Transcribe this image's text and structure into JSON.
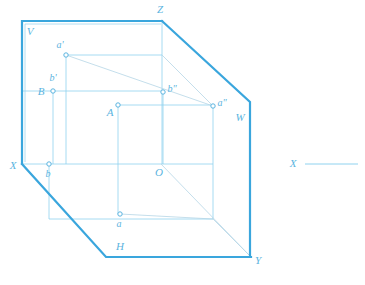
{
  "diagram": {
    "colors": {
      "outline": "#3aa6dd",
      "thin_line": "#7fcdec",
      "construction_line": "#a9d9ee",
      "label": "#5bb4e0",
      "background": "#ffffff",
      "marker_fill": "#ffffff"
    },
    "planes": [
      {
        "name": "vertical-plane",
        "label": "V",
        "x": 30,
        "y": 32
      },
      {
        "name": "horizontal-plane",
        "label": "H",
        "x": 120,
        "y": 247
      },
      {
        "name": "profile-plane",
        "label": "W",
        "x": 240,
        "y": 118
      }
    ],
    "axes": [
      {
        "name": "axis-z",
        "label": "Z",
        "x": 160,
        "y": 10
      },
      {
        "name": "axis-x",
        "label": "X",
        "x": 13,
        "y": 166
      },
      {
        "name": "axis-y",
        "label": "Y",
        "x": 258,
        "y": 261
      },
      {
        "name": "origin",
        "label": "O",
        "x": 159,
        "y": 173
      }
    ],
    "points": [
      {
        "name": "point-a-front-view",
        "label": "a'",
        "px": 66,
        "py": 55,
        "lx": 60,
        "ly": 46
      },
      {
        "name": "point-b-front-view",
        "label": "b'",
        "px": 53,
        "py": 91,
        "lx": 53,
        "ly": 79
      },
      {
        "name": "point-b-space",
        "label": "B",
        "px": 53,
        "py": 91,
        "lx": 41,
        "ly": 92
      },
      {
        "name": "point-b-profile-view",
        "label": "b\"",
        "px": 163,
        "py": 92,
        "lx": 171,
        "ly": 90
      },
      {
        "name": "point-a-space",
        "label": "A",
        "px": 118,
        "py": 105,
        "lx": 110,
        "ly": 113
      },
      {
        "name": "point-a-profile-view",
        "label": "a\"",
        "px": 213,
        "py": 106,
        "lx": 221,
        "ly": 104
      },
      {
        "name": "point-b-top-view",
        "label": "b",
        "px": 49,
        "py": 164,
        "lx": 48,
        "ly": 175
      },
      {
        "name": "point-a-top-view",
        "label": "a",
        "px": 120,
        "py": 214,
        "lx": 119,
        "ly": 225
      }
    ],
    "side_axis": {
      "name": "standalone-x-axis",
      "label": "X",
      "label_x": 296,
      "label_y": 164,
      "line_x1": 305,
      "line_y1": 164,
      "line_x2": 358,
      "line_y2": 164
    }
  }
}
